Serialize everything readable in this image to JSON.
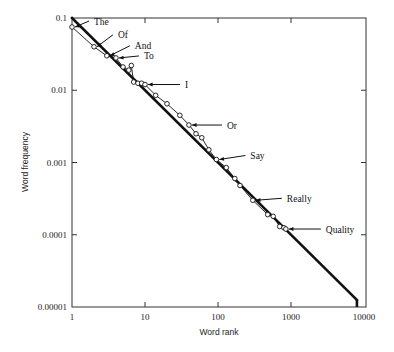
{
  "chart_data": {
    "type": "line",
    "title": "",
    "xlabel": "Word rank",
    "ylabel": "Word frequency",
    "xscale": "log",
    "yscale": "log",
    "xlim": [
      1,
      10000
    ],
    "ylim": [
      1e-05,
      0.1
    ],
    "x_ticks": [
      "1",
      "10",
      "100",
      "1000",
      "10000"
    ],
    "y_ticks": [
      "0.1",
      "0.01",
      "0.001",
      "0.0001",
      "0.00001"
    ],
    "grid": false,
    "legend": null,
    "series": [
      {
        "name": "Zipf law (ideal)",
        "style": "thick solid line",
        "x": [
          1,
          8000
        ],
        "y": [
          0.1,
          1.25e-05
        ]
      },
      {
        "name": "Observed word frequencies",
        "style": "thin line with open circle markers",
        "x": [
          1,
          2,
          3,
          4,
          5,
          6,
          6.5,
          7,
          8,
          9,
          10,
          14,
          20,
          30,
          40,
          50,
          60,
          75,
          95,
          130,
          170,
          200,
          300,
          480,
          570,
          700,
          800,
          850
        ],
        "y": [
          0.075,
          0.04,
          0.03,
          0.028,
          0.021,
          0.019,
          0.022,
          0.013,
          0.0125,
          0.0125,
          0.012,
          0.0085,
          0.0065,
          0.0045,
          0.0033,
          0.0025,
          0.0022,
          0.0015,
          0.0011,
          0.00085,
          0.0006,
          0.00048,
          0.0003,
          0.00019,
          0.00018,
          0.00013,
          0.000125,
          0.00012
        ]
      }
    ],
    "annotations": [
      {
        "text": "The",
        "x": 1,
        "y": 0.075
      },
      {
        "text": "Of",
        "x": 2,
        "y": 0.04
      },
      {
        "text": "And",
        "x": 3,
        "y": 0.03
      },
      {
        "text": "To",
        "x": 4,
        "y": 0.028
      },
      {
        "text": "I",
        "x": 10,
        "y": 0.012
      },
      {
        "text": "Or",
        "x": 40,
        "y": 0.0033
      },
      {
        "text": "Say",
        "x": 95,
        "y": 0.0011
      },
      {
        "text": "Really",
        "x": 300,
        "y": 0.0003
      },
      {
        "text": "Quality",
        "x": 850,
        "y": 0.00012
      }
    ]
  },
  "layout": {
    "plot": {
      "left": 72,
      "right": 366,
      "top": 18,
      "bottom": 307
    },
    "x_decades_px": 73,
    "y_decades_px": 72.25,
    "ink_color": "#111111",
    "annotation_offsets": {
      "The": [
        20,
        -6
      ],
      "Of": [
        22,
        -12
      ],
      "And": [
        26,
        -10
      ],
      "To": [
        26,
        -2
      ],
      "I": [
        38,
        0
      ],
      "Or": [
        36,
        0
      ],
      "Say": [
        32,
        -4
      ],
      "Really": [
        32,
        -2
      ],
      "Quality": [
        38,
        0
      ]
    }
  }
}
